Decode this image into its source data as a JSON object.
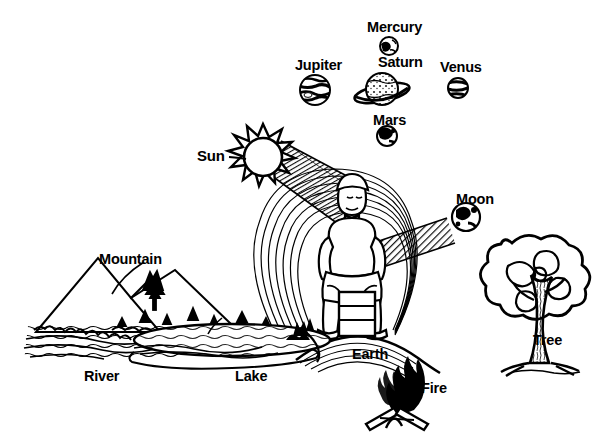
{
  "diagram": {
    "background_color": "#ffffff",
    "ink_color": "#000000",
    "labels": {
      "mercury": "Mercury",
      "jupiter": "Jupiter",
      "saturn": "Saturn",
      "venus": "Venus",
      "mars": "Mars",
      "sun": "Sun",
      "moon": "Moon",
      "mountain": "Mountain",
      "river": "River",
      "lake": "Lake",
      "earth": "Earth",
      "fire": "Fire",
      "tree": "Tree"
    },
    "figures": {
      "meditating_person": "seated-person-with-aura",
      "campfire": "campfire-with-logs",
      "deciduous_tree": "tree",
      "mountain_range": "mountains",
      "water_body": "lake-and-river",
      "sun_body": "sun-with-rays",
      "moon_body": "crescent-moon-disc",
      "sun_beam": "hatched-energy-beam",
      "moon_beam": "hatched-energy-beam"
    },
    "planet_icons": [
      {
        "name": "mercury-icon",
        "cx": 389,
        "cy": 46,
        "r": 9
      },
      {
        "name": "jupiter-icon",
        "cx": 315,
        "cy": 90,
        "r": 15
      },
      {
        "name": "saturn-icon",
        "cx": 382,
        "cy": 90,
        "r": 16
      },
      {
        "name": "venus-icon",
        "cx": 458,
        "cy": 88,
        "r": 10
      },
      {
        "name": "mars-icon",
        "cx": 387,
        "cy": 136,
        "r": 10
      }
    ]
  }
}
